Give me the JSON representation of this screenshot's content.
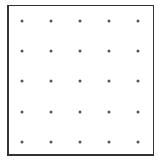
{
  "grid": {
    "rows": 5,
    "cols": 5,
    "x_positions": [
      22,
      51,
      80,
      109,
      138
    ],
    "y_positions": [
      21,
      51,
      81,
      112,
      142
    ],
    "dot_color": "#555555",
    "border_color": "#333333"
  }
}
